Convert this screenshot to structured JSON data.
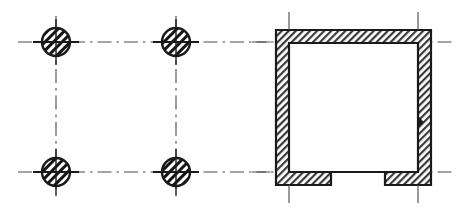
{
  "drawing": {
    "title": "Structural floor plan detail",
    "description": "Architectural plan: four hatched round columns on a rectangular grid at left, and a C-shaped hatched masonry wall enclosure with a bottom opening at right",
    "canvas": {
      "width": 463,
      "height": 222,
      "background": "#ffffff"
    },
    "style": {
      "ink": "#1a1a1a",
      "hatch_fill": "#9a9a9a",
      "wall_hatch_fill": "#a8a8a8",
      "centerline_color": "#4a4a4a",
      "centerline_dash": "14,5,2.5,5",
      "line_width_heavy": 2.2,
      "line_width_light": 1.1
    },
    "left_assembly": {
      "name": "column-grid",
      "column_radius": 14,
      "column_label": "round concrete column",
      "columns": [
        {
          "id": "col-A1",
          "cx": 56,
          "cy": 42
        },
        {
          "id": "col-B1",
          "cx": 176,
          "cy": 42
        },
        {
          "id": "col-A2",
          "cx": 56,
          "cy": 172
        },
        {
          "id": "col-B2",
          "cx": 176,
          "cy": 172
        }
      ],
      "horizontal_gridlines": [
        {
          "id": "grid-row-1",
          "y": 42,
          "x1": 18,
          "x2": 300
        },
        {
          "id": "grid-row-2",
          "y": 172,
          "x1": 18,
          "x2": 300
        }
      ],
      "vertical_gridlines": [
        {
          "id": "grid-col-A",
          "x": 56,
          "y1": 16,
          "y2": 200
        },
        {
          "id": "grid-col-B",
          "x": 176,
          "y1": 16,
          "y2": 200
        }
      ]
    },
    "right_assembly": {
      "name": "wall-enclosure",
      "wall_thickness": 13,
      "outer": {
        "x": 276,
        "y": 30,
        "width": 155,
        "height": 155
      },
      "opening": {
        "id": "bottom-opening",
        "x1": 331,
        "x2": 385,
        "y": 185,
        "label": "opening in south wall"
      },
      "joint_mark": {
        "id": "wall-joint",
        "x": 418,
        "y": 122,
        "size": 6
      },
      "tick_marks_top": [
        {
          "id": "tick-top-left",
          "x": 289,
          "y1": 12,
          "y2": 30
        },
        {
          "id": "tick-top-right",
          "x": 418,
          "y1": 12,
          "y2": 30
        }
      ],
      "tick_marks_bottom": [
        {
          "id": "tick-bottom-left",
          "x": 289,
          "y1": 185,
          "y2": 203
        },
        {
          "id": "tick-bottom-right",
          "x": 418,
          "y1": 185,
          "y2": 203
        }
      ],
      "horizontal_gridlines": [
        {
          "id": "wall-grid-row-1",
          "y": 42,
          "x1": 252,
          "x2": 455
        },
        {
          "id": "wall-grid-row-2",
          "y": 172,
          "x1": 252,
          "x2": 455
        }
      ]
    }
  }
}
